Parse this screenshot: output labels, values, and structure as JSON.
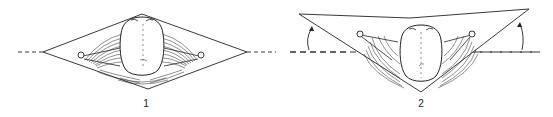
{
  "figures": [
    {
      "label": "1",
      "shape": "diamond",
      "description": "Frog viewed from above inside a diamond-shaped frame, limbs extended horizontally, horizontal dashed axis line"
    },
    {
      "label": "2",
      "shape": "inverted-triangle",
      "description": "Frog inside a tilted V-shaped frame, wings/limbs raised, curved arrows indicating upward rotation from the dashed horizontal axis"
    }
  ],
  "colors": {
    "line": "#222222",
    "background": "#ffffff"
  }
}
